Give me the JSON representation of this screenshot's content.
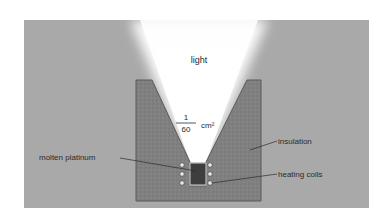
{
  "diagram": {
    "title_label": "light",
    "aperture": {
      "numerator": "1",
      "denominator": "60",
      "unit": "cm²"
    },
    "labels": {
      "insulation": "insulation",
      "molten_platinum": "molten platinum",
      "heating_coils": "heating coils"
    },
    "colors": {
      "background": "#a9a9a9",
      "insulation": "#7f7f7f",
      "crucible": "#3e3e3e",
      "light": "#ffffff",
      "text": "#2b2b2b"
    },
    "coils_per_side": 3
  }
}
